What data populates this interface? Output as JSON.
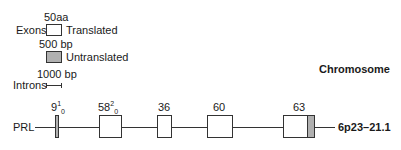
{
  "legend": {
    "exon_scale": "50aa",
    "exons_label": "Exons",
    "translated_label": "Translated",
    "utr_scale": "500 bp",
    "untranslated_label": "Untranslated",
    "intron_scale": "1000 bp",
    "introns_label": "Introns"
  },
  "chromosome_header": "Chromosome",
  "gene": {
    "name": "PRL",
    "chromosome_location": "6p23–21.1",
    "exons": [
      {
        "size": "9",
        "sup": "1",
        "sub": "0"
      },
      {
        "size": "58",
        "sup": "2",
        "sub": "0"
      },
      {
        "size": "36"
      },
      {
        "size": "60"
      },
      {
        "size": "63"
      }
    ]
  },
  "colors": {
    "translated": "#ffffff",
    "untranslated": "#b0b0b0",
    "stroke": "#333333"
  }
}
